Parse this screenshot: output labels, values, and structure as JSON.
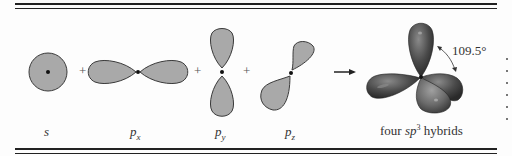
{
  "figure": {
    "orbitals": [
      {
        "id": "s",
        "label": "s",
        "shape": "sphere"
      },
      {
        "id": "px",
        "label": "p",
        "subscript": "x",
        "shape": "dumbbell-horizontal"
      },
      {
        "id": "py",
        "label": "p",
        "subscript": "y",
        "shape": "dumbbell-vertical"
      },
      {
        "id": "pz",
        "label": "p",
        "subscript": "z",
        "shape": "dumbbell-diagonal"
      }
    ],
    "operators": [
      "+",
      "+",
      "+"
    ],
    "arrow": "→",
    "result": {
      "label_prefix": "four ",
      "label_italic": "sp",
      "label_sup": "3",
      "label_suffix": " hybrids",
      "angle": "109.5°"
    },
    "colors": {
      "orbital_fill": "#a9a9a9",
      "orbital_stroke": "#3a3a3a",
      "hybrid_dark": "#3d3d3d",
      "hybrid_mid": "#5a5a5a",
      "hybrid_light": "#7a7a7a",
      "rule": "#222222"
    }
  }
}
